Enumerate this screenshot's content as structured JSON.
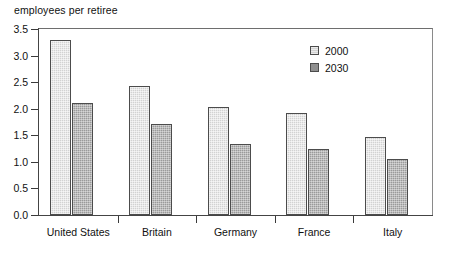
{
  "chart_data": {
    "type": "bar",
    "title": "",
    "ylabel": "employees per retiree",
    "xlabel": "",
    "ylim": [
      0.0,
      3.5
    ],
    "yticks": [
      "0.0",
      "0.5",
      "1.0",
      "1.5",
      "2.0",
      "2.5",
      "3.0",
      "3.5"
    ],
    "ytick_values": [
      0.0,
      0.5,
      1.0,
      1.5,
      2.0,
      2.5,
      3.0,
      3.5
    ],
    "grid": false,
    "legend_position": "top-right",
    "categories": [
      "United States",
      "Britain",
      "Germany",
      "France",
      "Italy"
    ],
    "series": [
      {
        "name": "2000",
        "color": "#d2d2d2",
        "values": [
          3.3,
          2.42,
          2.03,
          1.92,
          1.47
        ]
      },
      {
        "name": "2030",
        "color": "#9a9a9a",
        "values": [
          2.1,
          1.72,
          1.34,
          1.25,
          1.06
        ]
      }
    ]
  },
  "legend": {
    "items": [
      {
        "label": "2000"
      },
      {
        "label": "2030"
      }
    ]
  }
}
